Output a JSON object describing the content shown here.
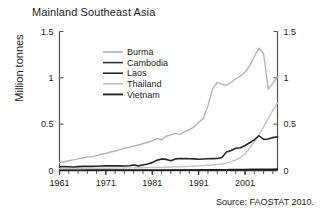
{
  "chart_data": {
    "type": "line",
    "title": "Mainland Southeast Asia",
    "xlabel": "",
    "ylabel": "Million tonnes",
    "source": "Source: FAOSTAT 2010.",
    "xlim": [
      1961,
      2008
    ],
    "ylim": [
      0,
      1.5
    ],
    "xticks": [
      1961,
      1971,
      1981,
      1991,
      2001
    ],
    "yticks": [
      0,
      0.5,
      1,
      1.5
    ],
    "yticklabels": [
      "0",
      "0.5",
      "1",
      "1.5"
    ],
    "right_axis": true,
    "right_yticklabels": [
      "0",
      "0.5",
      "1",
      "1.5"
    ],
    "grid": false,
    "legend_position": "upper-left-inside",
    "x": [
      1961,
      1962,
      1963,
      1964,
      1965,
      1966,
      1967,
      1968,
      1969,
      1970,
      1971,
      1972,
      1973,
      1974,
      1975,
      1976,
      1977,
      1978,
      1979,
      1980,
      1981,
      1982,
      1983,
      1984,
      1985,
      1986,
      1987,
      1988,
      1989,
      1990,
      1991,
      1992,
      1993,
      1994,
      1995,
      1996,
      1997,
      1998,
      1999,
      2000,
      2001,
      2002,
      2003,
      2004,
      2005,
      2006,
      2007,
      2008
    ],
    "series": [
      {
        "name": "Burma",
        "color": "#b4b4b4",
        "width": 1.4,
        "values": [
          0.085,
          0.095,
          0.105,
          0.115,
          0.125,
          0.135,
          0.145,
          0.15,
          0.16,
          0.175,
          0.185,
          0.2,
          0.21,
          0.225,
          0.24,
          0.25,
          0.265,
          0.275,
          0.29,
          0.305,
          0.32,
          0.345,
          0.33,
          0.37,
          0.385,
          0.4,
          0.39,
          0.42,
          0.44,
          0.47,
          0.52,
          0.56,
          0.7,
          0.88,
          0.95,
          0.93,
          0.92,
          0.95,
          0.99,
          1.02,
          1.06,
          1.13,
          1.23,
          1.32,
          1.26,
          0.88,
          0.94,
          1.01
        ]
      },
      {
        "name": "Cambodia",
        "color": "#2b2b2b",
        "width": 1.2,
        "values": [
          0.005,
          0.005,
          0.005,
          0.005,
          0.005,
          0.005,
          0.005,
          0.005,
          0.005,
          0.005,
          0.005,
          0.004,
          0.004,
          0.004,
          0.004,
          0.004,
          0.004,
          0.004,
          0.004,
          0.005,
          0.005,
          0.005,
          0.005,
          0.005,
          0.006,
          0.006,
          0.006,
          0.007,
          0.007,
          0.008,
          0.008,
          0.009,
          0.009,
          0.01,
          0.01,
          0.011,
          0.011,
          0.012,
          0.012,
          0.013,
          0.013,
          0.014,
          0.014,
          0.015,
          0.015,
          0.016,
          0.016,
          0.017
        ]
      },
      {
        "name": "Laos",
        "color": "#1a1a1a",
        "width": 1.2,
        "values": [
          0.003,
          0.003,
          0.003,
          0.003,
          0.003,
          0.003,
          0.003,
          0.003,
          0.003,
          0.003,
          0.003,
          0.003,
          0.003,
          0.003,
          0.003,
          0.003,
          0.003,
          0.003,
          0.003,
          0.004,
          0.004,
          0.004,
          0.004,
          0.004,
          0.004,
          0.005,
          0.005,
          0.005,
          0.005,
          0.005,
          0.005,
          0.006,
          0.006,
          0.006,
          0.006,
          0.007,
          0.007,
          0.007,
          0.007,
          0.008,
          0.008,
          0.008,
          0.009,
          0.009,
          0.009,
          0.01,
          0.01,
          0.01
        ]
      },
      {
        "name": "Thailand",
        "color": "#c4c4c4",
        "width": 1.4,
        "values": [
          0.02,
          0.02,
          0.021,
          0.021,
          0.022,
          0.022,
          0.023,
          0.023,
          0.024,
          0.024,
          0.025,
          0.025,
          0.026,
          0.026,
          0.027,
          0.028,
          0.028,
          0.029,
          0.03,
          0.031,
          0.032,
          0.033,
          0.034,
          0.035,
          0.037,
          0.039,
          0.041,
          0.043,
          0.045,
          0.048,
          0.05,
          0.053,
          0.056,
          0.06,
          0.065,
          0.07,
          0.08,
          0.095,
          0.115,
          0.14,
          0.18,
          0.24,
          0.31,
          0.39,
          0.47,
          0.56,
          0.65,
          0.73
        ]
      },
      {
        "name": "Vietnam",
        "color": "#262626",
        "width": 1.6,
        "values": [
          0.04,
          0.042,
          0.04,
          0.038,
          0.042,
          0.044,
          0.046,
          0.044,
          0.046,
          0.048,
          0.05,
          0.05,
          0.052,
          0.05,
          0.048,
          0.052,
          0.06,
          0.05,
          0.06,
          0.07,
          0.085,
          0.11,
          0.125,
          0.12,
          0.105,
          0.125,
          0.13,
          0.128,
          0.126,
          0.125,
          0.122,
          0.124,
          0.126,
          0.128,
          0.13,
          0.14,
          0.2,
          0.215,
          0.24,
          0.245,
          0.27,
          0.3,
          0.33,
          0.375,
          0.335,
          0.34,
          0.355,
          0.365
        ]
      }
    ]
  },
  "axis": {
    "xtick_labels": [
      "1961",
      "1971",
      "1981",
      "1991",
      "2001"
    ],
    "ytick_labels_left": [
      "1.5",
      "1",
      "0.5",
      "0"
    ],
    "ytick_labels_right": [
      "1.5",
      "1",
      "0.5",
      "0"
    ]
  },
  "legend": {
    "entries": [
      {
        "label": "Burma"
      },
      {
        "label": "Cambodia"
      },
      {
        "label": "Laos"
      },
      {
        "label": "Thailand"
      },
      {
        "label": "Vietnam"
      }
    ]
  }
}
